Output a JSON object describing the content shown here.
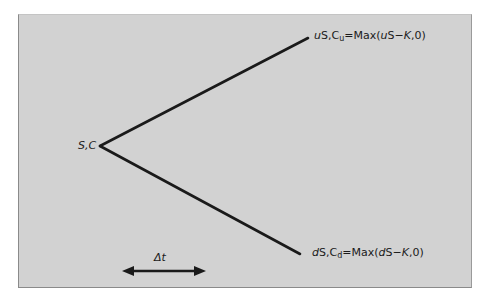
{
  "diagram": {
    "type": "binomial-tree-one-step",
    "background_color": "#d2d2d2",
    "line_color": "#1a1a1a",
    "nodes": {
      "root": {
        "label_italic": "S,C"
      },
      "up": {
        "var1_italic": "u",
        "var1_rest": "S,C",
        "sub": "u",
        "eq": "=Max(",
        "arg_italic": "u",
        "arg_rest": "S−",
        "k_italic": "K",
        "tail": ",0)"
      },
      "down": {
        "var1_italic": "d",
        "var1_rest": "S,C",
        "sub": "d",
        "eq": "=Max(",
        "arg_italic": "d",
        "arg_rest": "S−",
        "k_italic": "K",
        "tail": ",0)"
      }
    },
    "time_step": {
      "label": "Δt"
    }
  }
}
